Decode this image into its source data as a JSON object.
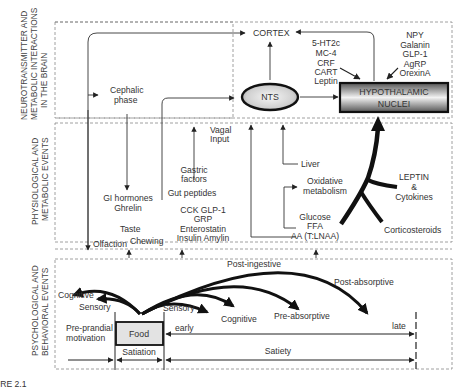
{
  "sections": {
    "brain": {
      "title_line1": "NEUROTRANSMITTER AND",
      "title_line2": "METABOLIC INTERACTIONS",
      "title_line3": "IN THE BRAIN"
    },
    "physio": {
      "title_line1": "PHYSIOLOGICAL AND",
      "title_line2": "METABOLIC EVENTS"
    },
    "psych": {
      "title_line1": "PSYCHOLOGICAL AND",
      "title_line2": "BEHAVIORAL EVENTS"
    }
  },
  "brain": {
    "cortex": "CORTEX",
    "cephalic_line1": "Cephalic",
    "cephalic_line2": "phase",
    "nts": "NTS",
    "hypo_line1": "HYPOTHALAMIC",
    "hypo_line2": "NUCLEI",
    "mediators_left": [
      "5-HT2c",
      "MC-4",
      "CRF",
      "CART",
      "Leptin"
    ],
    "mediators_right": [
      "NPY",
      "Galanin",
      "GLP-1",
      "AgRP",
      "OrexinA"
    ]
  },
  "physio": {
    "vagal_line1": "Vagal",
    "vagal_line2": "Input",
    "gastric_line1": "Gastric",
    "gastric_line2": "factors",
    "gut_peptides": "Gut peptides",
    "gut_list": [
      "CCK   GLP-1",
      "GRP",
      "Enterostatin",
      "Insulin Amylin"
    ],
    "gi_line1": "GI hormones",
    "gi_line2": "Ghrelin",
    "taste": "Taste",
    "chewing": "Chewing",
    "olfaction": "Olfaction",
    "liver": "Liver",
    "oxidative_line1": "Oxidative",
    "oxidative_line2": "metabolism",
    "nutrients": [
      "Glucose",
      "FFA",
      "AA (T:LNAA)"
    ],
    "leptin_line1": "LEPTIN",
    "leptin_line2": "&",
    "leptin_line3": "Cytokines",
    "corticosteroids": "Corticosteroids"
  },
  "psych": {
    "post_ingestive": "Post-ingestive",
    "post_absorptive": "Post-absorptive",
    "cognitive_left": "Cognitive",
    "sensory_left": "Sensory",
    "sensory_right": "Sensory",
    "cognitive_right": "Cognitive",
    "pre_absorptive": "Pre-absorptive",
    "pre_prandial_line1": "Pre-prandial",
    "pre_prandial_line2": "motivation",
    "food": "Food",
    "early": "early",
    "late": "late",
    "satiation": "Satiation",
    "satiety": "Satiety"
  },
  "caption": "URE 2.1"
}
